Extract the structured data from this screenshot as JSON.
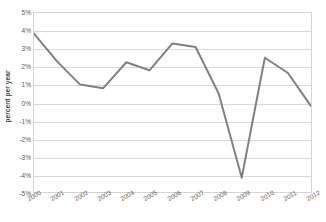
{
  "chart_data": {
    "type": "line",
    "title": "",
    "subtitle": "",
    "xlabel": "",
    "ylabel": "percent per year",
    "categories": [
      "2000",
      "2001",
      "2002",
      "2003",
      "2004",
      "2005",
      "2006",
      "2007",
      "2008",
      "2009",
      "2010",
      "2011",
      "2012"
    ],
    "x": [
      2000,
      2001,
      2002,
      2003,
      2004,
      2005,
      2006,
      2007,
      2008,
      2009,
      2010,
      2011,
      2012
    ],
    "values": [
      3.85,
      2.3,
      1.0,
      0.8,
      2.25,
      1.8,
      3.3,
      3.1,
      0.5,
      -4.2,
      2.5,
      1.65,
      -0.2
    ],
    "series": [
      {
        "name": "percent per year",
        "values": [
          3.85,
          2.3,
          1.0,
          0.8,
          2.25,
          1.8,
          3.3,
          3.1,
          0.5,
          -4.2,
          2.5,
          1.65,
          -0.2
        ]
      }
    ],
    "ylim": [
      -5,
      5
    ],
    "ytick_values": [
      5,
      4,
      3,
      2,
      1,
      0,
      -1,
      -2,
      -3,
      -4,
      -5
    ],
    "ytick_labels": [
      "5%",
      "4%",
      "3%",
      "2%",
      "1%",
      "0%",
      "-1%",
      "-2%",
      "-3%",
      "-4%",
      "-5%"
    ],
    "xtick_labels": [
      "2000",
      "2001",
      "2002",
      "2003",
      "2004",
      "2005",
      "2006",
      "2007",
      "2008",
      "2009",
      "2010",
      "2011",
      "2012"
    ],
    "grid": true,
    "grid_axis": "y",
    "legend": false,
    "legend_position": "none",
    "annotations": [],
    "colors": {
      "line": "#808080",
      "gridline": "#d9d9d9",
      "plot_border": "#d4d4d4",
      "tick_label": "#5a5a5a",
      "axis_title": "#3d3d3d",
      "background": "#ffffff"
    },
    "line_width": 2
  }
}
